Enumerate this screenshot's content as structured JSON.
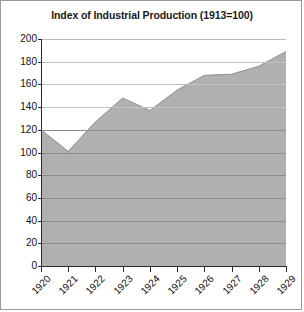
{
  "chart": {
    "title": "Index of Industrial Production (1913=100)"
  },
  "chart_data": {
    "type": "area",
    "title": "Index of Industrial Production (1913=100)",
    "xlabel": "",
    "ylabel": "",
    "categories": [
      "1920",
      "1921",
      "1922",
      "1923",
      "1924",
      "1925",
      "1926",
      "1927",
      "1928",
      "1929"
    ],
    "x": [
      1920,
      1921,
      1922,
      1923,
      1924,
      1925,
      1926,
      1927,
      1928,
      1929
    ],
    "values": [
      120,
      101,
      127,
      148,
      137,
      155,
      168,
      169,
      176,
      189
    ],
    "series": [
      {
        "name": "Index of Industrial Production",
        "values": [
          120,
          101,
          127,
          148,
          137,
          155,
          168,
          169,
          176,
          189
        ]
      }
    ],
    "ylim": [
      0,
      200
    ],
    "ytick_values": [
      0,
      20,
      40,
      60,
      80,
      100,
      120,
      140,
      160,
      180,
      200
    ],
    "ytick_labels": [
      "0",
      "20",
      "40",
      "60",
      "80",
      "100",
      "120",
      "140",
      "160",
      "180",
      "200"
    ],
    "xtick_labels": [
      "1920",
      "1921",
      "1922",
      "1923",
      "1924",
      "1925",
      "1926",
      "1927",
      "1928",
      "1929"
    ],
    "grid": true,
    "legend": false,
    "fill_color": "#b0b0b0",
    "line_color": "#8c8c8c",
    "gridline_color": "#8c8c8c",
    "axis_color": "#2b2b2b",
    "background_color": "#ffffff"
  }
}
